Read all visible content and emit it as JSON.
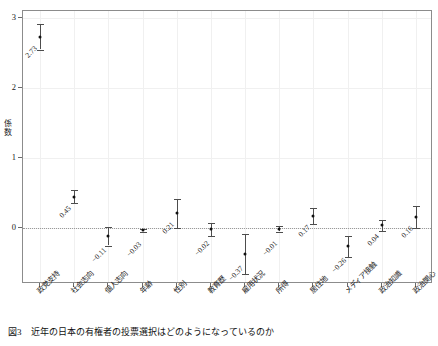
{
  "caption": {
    "number": "図3",
    "text": "近年の日本の有権者の投票選択はどのようになっているのか"
  },
  "chart_data": {
    "type": "scatter",
    "title": "",
    "subtitle": "",
    "xlabel": "",
    "ylabel": "係数",
    "ylim": [
      -0.8,
      3.1
    ],
    "yticks": [
      "0",
      "1",
      "2",
      "3"
    ],
    "ytick_values": [
      0,
      1,
      2,
      3
    ],
    "grid": true,
    "legend": "none",
    "zero_reference_line": 0,
    "error_bar_type": "confidence-interval",
    "categories": [
      "政党支持",
      "社会志向",
      "個人志向",
      "年齢",
      "性別",
      "教育歴",
      "雇用状況",
      "所得",
      "居住地",
      "メディア接触",
      "政治知識",
      "政治関心"
    ],
    "values": [
      2.73,
      0.45,
      -0.11,
      -0.03,
      0.21,
      -0.02,
      -0.37,
      -0.01,
      0.17,
      -0.26,
      0.04,
      0.16
    ],
    "value_labels": [
      "2.73",
      "0.45",
      "−0.11",
      "−0.03",
      "0.21",
      "−0.02",
      "−0.37",
      "−0.01",
      "0.17",
      "−0.26",
      "0.04",
      "0.16"
    ],
    "ci_lower": [
      2.55,
      0.36,
      -0.25,
      -0.05,
      0.0,
      -0.11,
      -0.66,
      -0.05,
      0.06,
      -0.41,
      -0.04,
      0.0
    ],
    "ci_upper": [
      2.92,
      0.54,
      0.02,
      -0.01,
      0.42,
      0.07,
      -0.09,
      0.03,
      0.29,
      -0.12,
      0.12,
      0.31
    ]
  }
}
